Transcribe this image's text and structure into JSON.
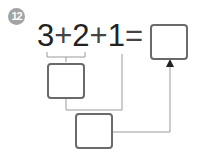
{
  "problem": {
    "number": "12",
    "terms": [
      "3",
      "2",
      "1"
    ],
    "operators": [
      "+",
      "+",
      "="
    ]
  }
}
